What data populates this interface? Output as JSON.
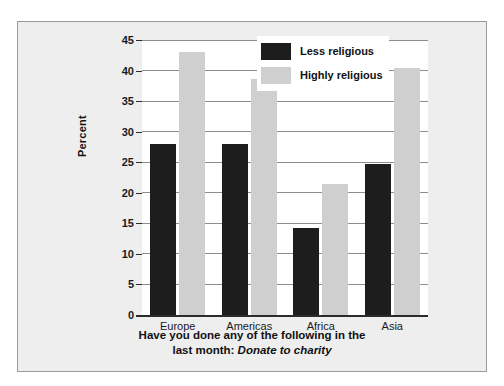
{
  "chart_data": {
    "type": "bar",
    "title": "",
    "caption_line1": "Have you done any of the following in the",
    "caption_line2_prefix": "last month: ",
    "caption_line2_italic": "Donate to charity",
    "categories": [
      "Europe",
      "Americas",
      "Africa",
      "Asia"
    ],
    "series": [
      {
        "name": "Less religious",
        "color": "#1d1d1d",
        "values": [
          28.0,
          28.0,
          14.3,
          24.7
        ]
      },
      {
        "name": "Highly religious",
        "color": "#cfcfcf",
        "values": [
          43.1,
          38.7,
          21.5,
          40.5
        ]
      }
    ],
    "xlabel": "",
    "ylabel": "Percent",
    "ylim": [
      0,
      45
    ],
    "ytick_values": [
      0,
      5,
      10,
      15,
      20,
      25,
      30,
      35,
      40,
      45
    ],
    "ytick_labels": [
      "0",
      "5",
      "10",
      "15",
      "20",
      "25",
      "30",
      "35",
      "40",
      "45"
    ],
    "grid": "horizontal",
    "legend_position": "top-right"
  },
  "colors": {
    "panel_background": "#eeeeee",
    "plot_background": "#ffffff",
    "axis": "#2b2b2b",
    "gridline": "#8d8d8d",
    "less_religious": "#1d1d1d",
    "highly_religious": "#cfcfcf"
  }
}
